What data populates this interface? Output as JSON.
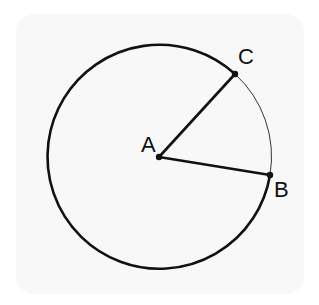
{
  "diagram": {
    "type": "circle-with-radii",
    "center": {
      "label": "A",
      "x": 159,
      "y": 157
    },
    "radius": 112,
    "points": [
      {
        "label": "A",
        "x": 159,
        "y": 157,
        "label_x": 141,
        "label_y": 152
      },
      {
        "label": "B",
        "x": 270,
        "y": 175,
        "label_x": 274,
        "label_y": 197
      },
      {
        "label": "C",
        "x": 235,
        "y": 74,
        "label_x": 238,
        "label_y": 64
      }
    ],
    "segments": [
      {
        "from": "A",
        "to": "B"
      },
      {
        "from": "A",
        "to": "C"
      }
    ],
    "minor_arc": {
      "from": "C",
      "to": "B",
      "style": "thin"
    },
    "major_arc": {
      "from": "B",
      "to": "C",
      "style": "thick"
    },
    "colors": {
      "stroke": "#111111",
      "background": "#f8f8f8"
    }
  }
}
